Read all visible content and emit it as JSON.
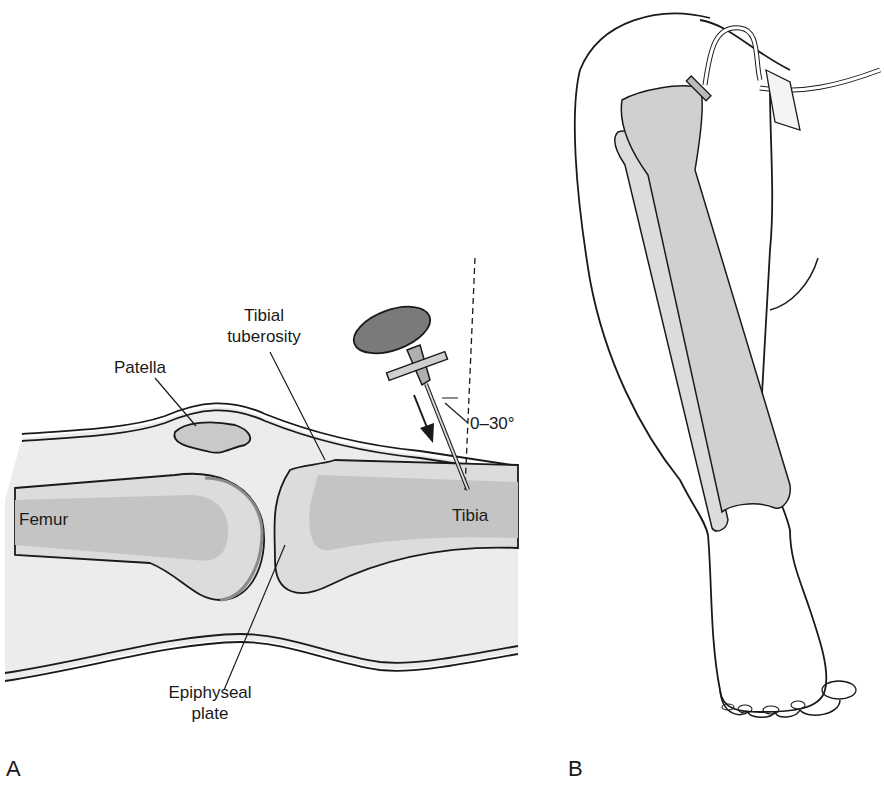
{
  "figure": {
    "panel_a": {
      "letter": "A",
      "labels": {
        "patella": "Patella",
        "tibial_tuberosity_line1": "Tibial",
        "tibial_tuberosity_line2": "tuberosity",
        "angle": "0–30°",
        "femur": "Femur",
        "tibia": "Tibia",
        "epiphyseal_line1": "Epiphyseal",
        "epiphyseal_line2": "plate"
      }
    },
    "panel_b": {
      "letter": "B"
    }
  },
  "colors": {
    "line": "#1a1a1a",
    "soft_tissue": "#ececec",
    "bone": "#c9c9c9",
    "bone_light": "#dcdcdc",
    "needle_head": "#7a7a7a"
  }
}
